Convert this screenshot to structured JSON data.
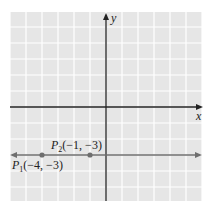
{
  "chart_data": {
    "type": "line",
    "title": "",
    "xlabel": "x",
    "ylabel": "y",
    "xlim": [
      -6,
      6
    ],
    "ylim": [
      -6,
      6
    ],
    "grid": true,
    "grid_step": 1,
    "colors": {
      "background": "#e6e6e6",
      "grid": "#ffffff",
      "axes": "#222222",
      "line": "#6e6e6e",
      "points": "#6e6e6e"
    },
    "series": [
      {
        "name": "horizontal line y = -3",
        "type": "line",
        "equation": "y = -3",
        "arrows": "both",
        "x": [
          -6,
          6
        ],
        "y": [
          -3,
          -3
        ]
      }
    ],
    "points": [
      {
        "label_main": "P",
        "label_sub": "1",
        "label_coords": "(−4, −3)",
        "x": -4,
        "y": -3,
        "label_position": "below-left"
      },
      {
        "label_main": "P",
        "label_sub": "2",
        "label_coords": "(−1, −3)",
        "x": -1,
        "y": -3,
        "label_position": "above"
      }
    ],
    "annotations": [
      "P1(−4, −3)",
      "P2(−1, −3)"
    ]
  }
}
